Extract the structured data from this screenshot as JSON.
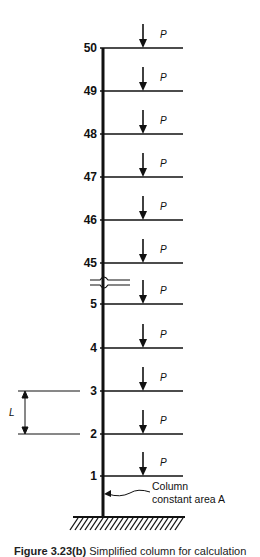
{
  "diagram": {
    "floors": [
      {
        "label": "50",
        "y": 48,
        "load": "P"
      },
      {
        "label": "49",
        "y": 91,
        "load": "P"
      },
      {
        "label": "48",
        "y": 134,
        "load": "P"
      },
      {
        "label": "47",
        "y": 177,
        "load": "P"
      },
      {
        "label": "46",
        "y": 220,
        "load": "P"
      },
      {
        "label": "45",
        "y": 263,
        "load": "P"
      },
      {
        "label": "5",
        "y": 304,
        "load": "P"
      },
      {
        "label": "4",
        "y": 348,
        "load": "P"
      },
      {
        "label": "3",
        "y": 391,
        "load": "P"
      },
      {
        "label": "2",
        "y": 434,
        "load": "P"
      },
      {
        "label": "1",
        "y": 476,
        "load": "P"
      }
    ],
    "dimension_label": "L",
    "column_note_line1": "Column",
    "column_note_line2": "constant area A",
    "colors": {
      "ink": "#111111",
      "background": "#ffffff"
    }
  },
  "caption": {
    "figure_number": "Figure 3.23(b)",
    "text": "Simplified column for calculation"
  }
}
